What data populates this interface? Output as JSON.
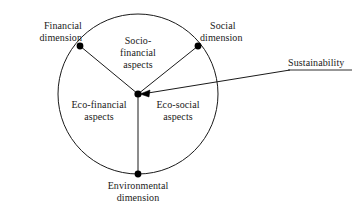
{
  "figure": {
    "type": "venn-sector-circle-diagram",
    "background_color": "#ffffff",
    "stroke_color": "#1a1a1a",
    "node_color": "#000000",
    "circle": {
      "cx": 138,
      "cy": 94,
      "r": 80
    }
  },
  "dimensions": [
    {
      "id": "financial-dimension",
      "line1": "Financial",
      "line2": "dimension",
      "node_x": 80,
      "node_y": 46
    },
    {
      "id": "social-dimension",
      "line1": "Social",
      "line2": "dimension",
      "node_x": 198,
      "node_y": 46
    },
    {
      "id": "environmental-dimension",
      "line1": "Environmental",
      "line2": "dimension",
      "node_x": 138,
      "node_y": 174
    }
  ],
  "sectors": [
    {
      "id": "socio-financial-aspects",
      "line1": "Socio-",
      "line2": "financial",
      "line3": "aspects"
    },
    {
      "id": "eco-financial-aspects",
      "line1": "Eco-financial",
      "line2": "aspects",
      "line3": ""
    },
    {
      "id": "eco-social-aspects",
      "line1": "Eco-social",
      "line2": "aspects",
      "line3": ""
    }
  ],
  "callout": {
    "id": "sustainability-callout",
    "label": "Sustainability",
    "target_x": 138,
    "target_y": 94
  }
}
